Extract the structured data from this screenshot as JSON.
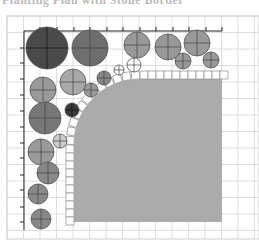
{
  "header": {
    "clipped_title": "Planting Plan with Stone Border"
  },
  "diagram": {
    "frame": {
      "x": 7,
      "y": 16,
      "w": 252,
      "h": 223
    },
    "grid_step": 16.5,
    "grid_color": "#d6d6d6",
    "axis": {
      "origin_x": 24,
      "origin_y": 31,
      "x_end": 222,
      "y_end": 230,
      "x_ticks": [
        40,
        57,
        74,
        90,
        107,
        123,
        140,
        156,
        173,
        189,
        206,
        222
      ],
      "y_ticks": [
        48,
        63,
        79,
        95,
        111,
        127,
        143,
        158,
        175,
        190,
        207,
        222
      ]
    },
    "lawn": {
      "fill": "#ababab",
      "left": 74,
      "top": 79,
      "right": 222,
      "bottom": 222,
      "corner_cx": 140,
      "corner_cy": 145,
      "corner_r": 66
    },
    "tiles": {
      "size": 8,
      "stroke": "#9a9a9a",
      "fill": "#ffffff"
    },
    "plants": [
      {
        "cx": 47,
        "cy": 48,
        "r": 21,
        "fill": "#4a4a4a"
      },
      {
        "cx": 90,
        "cy": 48,
        "r": 18,
        "fill": "#6e6e6e"
      },
      {
        "cx": 137,
        "cy": 45,
        "r": 13,
        "fill": "#999999"
      },
      {
        "cx": 168,
        "cy": 47,
        "r": 13,
        "fill": "#999999"
      },
      {
        "cx": 197,
        "cy": 43,
        "r": 13,
        "fill": "#999999"
      },
      {
        "cx": 183,
        "cy": 61,
        "r": 8,
        "fill": "#999999"
      },
      {
        "cx": 211,
        "cy": 60,
        "r": 8,
        "fill": "#999999"
      },
      {
        "cx": 134,
        "cy": 65,
        "r": 7,
        "fill": "#ffffff"
      },
      {
        "cx": 119,
        "cy": 70,
        "r": 5,
        "fill": "#ffffff"
      },
      {
        "cx": 43,
        "cy": 90,
        "r": 13,
        "fill": "#9a9a9a"
      },
      {
        "cx": 73,
        "cy": 82,
        "r": 13,
        "fill": "#a8a8a8"
      },
      {
        "cx": 91,
        "cy": 90,
        "r": 7,
        "fill": "#999999"
      },
      {
        "cx": 104,
        "cy": 78,
        "r": 7,
        "fill": "#888888"
      },
      {
        "cx": 72,
        "cy": 110,
        "r": 7,
        "fill": "#3a3a3a"
      },
      {
        "cx": 45,
        "cy": 118,
        "r": 16,
        "fill": "#777777"
      },
      {
        "cx": 60,
        "cy": 141,
        "r": 7,
        "fill": "#cccccc"
      },
      {
        "cx": 41,
        "cy": 152,
        "r": 13,
        "fill": "#9a9a9a"
      },
      {
        "cx": 48,
        "cy": 173,
        "r": 11,
        "fill": "#888888"
      },
      {
        "cx": 38,
        "cy": 194,
        "r": 10,
        "fill": "#888888"
      },
      {
        "cx": 41,
        "cy": 219,
        "r": 10,
        "fill": "#888888"
      }
    ]
  }
}
